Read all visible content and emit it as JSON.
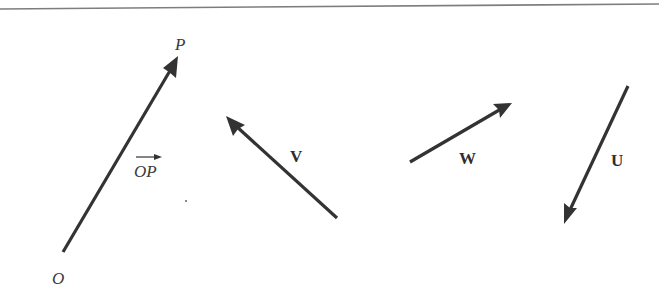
{
  "figure": {
    "type": "vector-diagram",
    "top_rule": {
      "x1": 0,
      "y1": 9,
      "x2": 659,
      "y2": 4,
      "color": "#7a7a7a"
    },
    "line_color": "#333333",
    "points": [
      {
        "id": "O",
        "label": "O",
        "x": 58,
        "y": 283
      },
      {
        "id": "P",
        "label": "P",
        "x": 178,
        "y": 50
      }
    ],
    "vectors": [
      {
        "id": "OP",
        "name": "position vector OP",
        "tail": {
          "x": 63,
          "y": 252
        },
        "head": {
          "x": 178,
          "y": 57
        },
        "label": "OP",
        "label_style": "italic-overarrow",
        "label_pos": {
          "x": 135,
          "y": 177
        }
      },
      {
        "id": "V",
        "name": "vector V",
        "tail": {
          "x": 337,
          "y": 218
        },
        "head": {
          "x": 226,
          "y": 117
        },
        "label": "V",
        "label_style": "bold",
        "label_pos": {
          "x": 290,
          "y": 162
        }
      },
      {
        "id": "W",
        "name": "vector W",
        "tail": {
          "x": 410,
          "y": 162
        },
        "head": {
          "x": 512,
          "y": 103
        },
        "label": "W",
        "label_style": "bold",
        "label_pos": {
          "x": 459,
          "y": 164
        }
      },
      {
        "id": "U",
        "name": "vector U",
        "tail": {
          "x": 628,
          "y": 86
        },
        "head": {
          "x": 564,
          "y": 224
        },
        "label": "U",
        "label_style": "bold",
        "label_pos": {
          "x": 611,
          "y": 166
        }
      }
    ]
  },
  "labels": {
    "O": "O",
    "P": "P",
    "OP": "OP",
    "V": "V",
    "W": "W",
    "U": "U"
  }
}
